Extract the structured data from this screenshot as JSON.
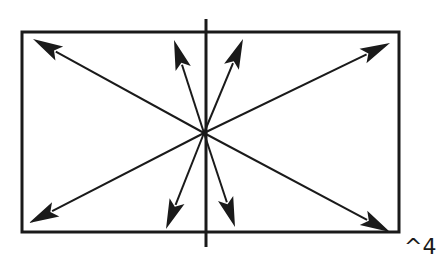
{
  "diagram": {
    "ink_color": "#1a1a1a",
    "background": "#ffffff",
    "rectangle": {
      "x1": 22,
      "y1": 32,
      "x2": 399,
      "y2": 232
    },
    "vertical_axis": {
      "x": 206,
      "y1": 19,
      "y2": 247
    },
    "center": {
      "x": 204,
      "y": 133
    },
    "arrows": [
      {
        "name": "arrow-up-left-far",
        "tip": [
          33,
          39
        ]
      },
      {
        "name": "arrow-up-left-near",
        "tip": [
          174,
          40
        ]
      },
      {
        "name": "arrow-up-right-near",
        "tip": [
          243,
          39
        ]
      },
      {
        "name": "arrow-up-right-far",
        "tip": [
          390,
          43
        ]
      },
      {
        "name": "arrow-down-left-far",
        "tip": [
          29,
          223
        ]
      },
      {
        "name": "arrow-down-left-near",
        "tip": [
          166,
          229
        ]
      },
      {
        "name": "arrow-down-right-near",
        "tip": [
          235,
          227
        ]
      },
      {
        "name": "arrow-down-right-far",
        "tip": [
          390,
          232
        ]
      }
    ]
  },
  "corner_label": "^4"
}
